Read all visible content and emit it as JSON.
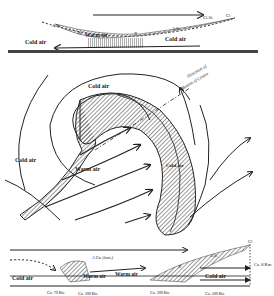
{
  "diagram": {
    "top_section": {
      "labels": {
        "cold_air_left": "Cold air",
        "warm_air": "Warm air",
        "cold_air_right": "Cold air",
        "as_left": "A.St.",
        "as_right": "A.St.",
        "cirro": "Ci.St.",
        "ci": "Ci",
        "n_left": "N",
        "n_right": "N"
      }
    },
    "plan_view": {
      "labels": {
        "cold_air_top": "Cold air",
        "cold_air_left": "Cold air",
        "warm_air": "Warm air",
        "cold_air_shaded": "Cold air",
        "direction": "Direction of",
        "motion": "Motion of Centre"
      }
    },
    "bottom_section": {
      "labels": {
        "cold_air_left": "Cold air",
        "warm_air_1": "Warm air",
        "warm_air_2": "Warm air",
        "cold_air_right": "Cold air",
        "cu": "A Cu (lent.)",
        "ci": "Ci",
        "as": "A.St.",
        "n": "N",
        "height": "Ca. 8 Km.",
        "dist_1": "Ca. 70 Km.",
        "dist_2": "Ca. 200 Km.",
        "dist_3": "Ca. 300 Km.",
        "dist_4": "Ca. 500 Km."
      }
    },
    "colors": {
      "ink": "#222222",
      "paper": "#ffffff"
    }
  }
}
